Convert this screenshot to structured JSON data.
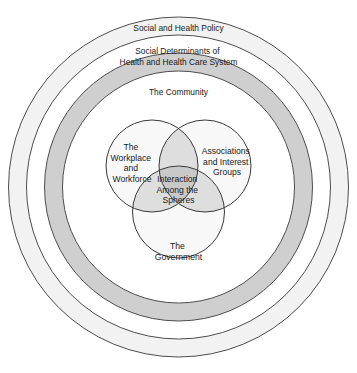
{
  "diagram": {
    "type": "concentric-rings-with-venn",
    "background_color": "#ffffff",
    "outline_color": "#4d4d4d",
    "text_color": "#1a1a1a",
    "geometry": {
      "center_x": 178.5,
      "center_y": 187,
      "outer_radius": 170,
      "ring_radii": [
        170,
        152,
        134,
        116
      ],
      "venn_radius": 46,
      "venn_centers": [
        {
          "cx": 152,
          "cy": 166
        },
        {
          "cx": 205,
          "cy": 166
        },
        {
          "cx": 178.5,
          "cy": 212
        }
      ]
    },
    "rings": [
      {
        "id": "social-and-health-policy",
        "label": "Social and Health Policy",
        "fill": "#f2f2f2",
        "label_x": 178.5,
        "label_y": 29,
        "lines": [
          "Social and Health Policy"
        ]
      },
      {
        "id": "social-determinants",
        "label": "Social Determinants of Health and Health Care System",
        "fill": "#cfcfcf",
        "label_x": 178.5,
        "label_y": 57,
        "lines": [
          "Social Determinants of",
          "Health and Health Care System"
        ]
      },
      {
        "id": "the-community",
        "label": "The Community",
        "fill": "#ffffff",
        "label_x": 178.5,
        "label_y": 93,
        "lines": [
          "The Community"
        ]
      }
    ],
    "venn_circles": [
      {
        "id": "workplace-and-workforce",
        "label": "The Workplace and Workforce",
        "fill": "#f7f7f7",
        "label_x": 132,
        "label_y": 163,
        "lines": [
          "The",
          "Workplace",
          "and",
          "Workforce"
        ]
      },
      {
        "id": "associations-and-interest-groups",
        "label": "Associations and Interest Groups",
        "fill": "#f7f7f7",
        "label_x": 227,
        "label_y": 163,
        "lines": [
          "Associations",
          "and Interest",
          "Groups"
        ]
      },
      {
        "id": "the-government",
        "label": "The Government",
        "fill": "#f7f7f7",
        "label_x": 178.5,
        "label_y": 252,
        "lines": [
          "The",
          "Government"
        ]
      }
    ],
    "center_intersection": {
      "id": "interaction-among-the-spheres",
      "label": "Interaction Among the Spheres",
      "fill": "#c9c9c9",
      "label_x": 178.5,
      "label_y": 190,
      "lines": [
        "Interaction",
        "Among the",
        "Spheres"
      ]
    }
  }
}
